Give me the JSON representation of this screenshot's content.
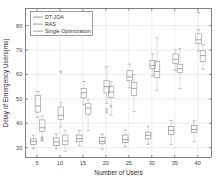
{
  "chart_data": {
    "type": "box",
    "title": "",
    "xlabel": "Number of Users",
    "ylabel": "Delay of Emergency Users(ms)",
    "xlim": [
      2.5,
      43
    ],
    "ylim": [
      26,
      87
    ],
    "xticks": [
      5,
      10,
      15,
      20,
      25,
      30,
      35,
      40
    ],
    "yticks": [
      30,
      40,
      50,
      60,
      70,
      80
    ],
    "grid": true,
    "legend_position": "top-left",
    "categories": [
      "5",
      "10",
      "15",
      "20",
      "25",
      "30",
      "35",
      "40"
    ],
    "series": [
      {
        "name": "DT-JOA",
        "color": "#7d7d7d",
        "boxes": [
          {
            "category": "5",
            "whisker_low": 29.6,
            "q1": 31.4,
            "median": 32.6,
            "q3": 33.6,
            "whisker_high": 35.1,
            "outliers": []
          },
          {
            "category": "10",
            "whisker_low": 29.5,
            "q1": 31.0,
            "median": 32.4,
            "q3": 34.0,
            "whisker_high": 35.6,
            "outliers": []
          },
          {
            "category": "15",
            "whisker_low": 30.8,
            "q1": 32.4,
            "median": 33.7,
            "q3": 35.2,
            "whisker_high": 37.0,
            "outliers": []
          },
          {
            "category": "20",
            "whisker_low": 29.4,
            "q1": 31.6,
            "median": 32.6,
            "q3": 34.1,
            "whisker_high": 35.6,
            "outliers": []
          },
          {
            "category": "25",
            "whisker_low": 30.5,
            "q1": 32.2,
            "median": 33.3,
            "q3": 35.2,
            "whisker_high": 37.2,
            "outliers": []
          },
          {
            "category": "30",
            "whisker_low": 31.4,
            "q1": 33.6,
            "median": 35.1,
            "q3": 36.4,
            "whisker_high": 38.8,
            "outliers": []
          },
          {
            "category": "35",
            "whisker_low": 31.4,
            "q1": 35.5,
            "median": 37.1,
            "q3": 38.6,
            "whisker_high": 41.2,
            "outliers": []
          },
          {
            "category": "40",
            "whisker_low": 32.6,
            "q1": 36.2,
            "median": 37.5,
            "q3": 39.1,
            "whisker_high": 41.0,
            "outliers": []
          }
        ]
      },
      {
        "name": "RAS",
        "color": "#8a8a8a",
        "boxes": [
          {
            "category": "5",
            "whisker_low": 42.5,
            "q1": 44.6,
            "median": 47.1,
            "q3": 51.3,
            "whisker_high": 53.0,
            "outliers": []
          },
          {
            "category": "10",
            "whisker_low": 38.5,
            "q1": 41.6,
            "median": 43.3,
            "q3": 46.7,
            "whisker_high": 48.4,
            "outliers": [
              61.1
            ]
          },
          {
            "category": "15",
            "whisker_low": 47.5,
            "q1": 50.4,
            "median": 52.5,
            "q3": 54.2,
            "whisker_high": 57.1,
            "outliers": []
          },
          {
            "category": "20",
            "whisker_low": 48.2,
            "q1": 52.4,
            "median": 55.0,
            "q3": 57.4,
            "whisker_high": 63.2,
            "outliers": [
              44.6,
              45.8
            ]
          },
          {
            "category": "25",
            "whisker_low": 54.5,
            "q1": 57.4,
            "median": 59.0,
            "q3": 61.6,
            "whisker_high": 64.2,
            "outliers": []
          },
          {
            "category": "30",
            "whisker_low": 59.4,
            "q1": 62.4,
            "median": 63.6,
            "q3": 65.8,
            "whisker_high": 68.4,
            "outliers": []
          },
          {
            "category": "35",
            "whisker_low": 61.7,
            "q1": 64.6,
            "median": 66.2,
            "q3": 68.4,
            "whisker_high": 70.0,
            "outliers": []
          },
          {
            "category": "40",
            "whisker_low": 69.6,
            "q1": 72.6,
            "median": 74.2,
            "q3": 76.6,
            "whisker_high": 78.4,
            "outliers": [
              85.4
            ]
          }
        ]
      },
      {
        "name": "Single Optimization",
        "color": "#8a8a8a",
        "boxes": [
          {
            "category": "5",
            "whisker_low": 32.8,
            "q1": 36.6,
            "median": 38.2,
            "q3": 41.4,
            "whisker_high": 43.0,
            "outliers": [
              33.4,
              34.2
            ]
          },
          {
            "category": "10",
            "whisker_low": 28.6,
            "q1": 31.2,
            "median": 32.8,
            "q3": 35.2,
            "whisker_high": 37.0,
            "outliers": []
          },
          {
            "category": "15",
            "whisker_low": 37.0,
            "q1": 43.6,
            "median": 46.2,
            "q3": 48.0,
            "whisker_high": 49.6,
            "outliers": []
          },
          {
            "category": "20",
            "whisker_low": 43.4,
            "q1": 50.6,
            "median": 52.8,
            "q3": 55.2,
            "whisker_high": 57.0,
            "outliers": [
              47.0
            ]
          },
          {
            "category": "25",
            "whisker_low": 44.8,
            "q1": 51.4,
            "median": 54.3,
            "q3": 56.8,
            "whisker_high": 60.0,
            "outliers": []
          },
          {
            "category": "30",
            "whisker_low": 53.6,
            "q1": 58.8,
            "median": 61.2,
            "q3": 65.2,
            "whisker_high": 75.0,
            "outliers": []
          },
          {
            "category": "35",
            "whisker_low": 54.2,
            "q1": 60.8,
            "median": 62.4,
            "q3": 64.2,
            "whisker_high": 70.6,
            "outliers": []
          },
          {
            "category": "40",
            "whisker_low": 62.2,
            "q1": 65.2,
            "median": 67.8,
            "q3": 69.8,
            "whisker_high": 72.2,
            "outliers": []
          }
        ]
      }
    ]
  },
  "legend": {
    "entries": [
      {
        "label": "DT-JOA"
      },
      {
        "label": "RAS"
      },
      {
        "label": "Single Optimization"
      }
    ]
  },
  "axes": {
    "x_title": "Number of Users",
    "y_title": "Delay of Emergency Users(ms)",
    "x_tick_labels": [
      "5",
      "10",
      "15",
      "20",
      "25",
      "30",
      "35",
      "40"
    ],
    "y_tick_labels": [
      "30",
      "40",
      "50",
      "60",
      "70",
      "80"
    ]
  },
  "colors": {
    "axis": "#4d4d4d",
    "grid": "#d8d8d8",
    "box": "#8a8a8a",
    "background": "#ffffff"
  }
}
